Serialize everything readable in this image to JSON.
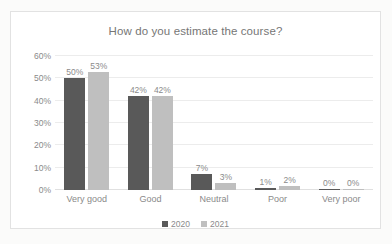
{
  "chart_data": {
    "type": "bar",
    "title": "How do you estimate the course?",
    "xlabel": "",
    "ylabel": "",
    "categories": [
      "Very good",
      "Good",
      "Neutral",
      "Poor",
      "Very poor"
    ],
    "series": [
      {
        "name": "2020",
        "color": "#595959",
        "values": [
          50,
          42,
          7,
          1,
          0
        ],
        "labels": [
          "50%",
          "42%",
          "7%",
          "1%",
          "0%"
        ]
      },
      {
        "name": "2021",
        "color": "#bfbfbf",
        "values": [
          53,
          42,
          3,
          2,
          0
        ],
        "labels": [
          "53%",
          "42%",
          "3%",
          "2%",
          "0%"
        ]
      }
    ],
    "ylim": [
      0,
      60
    ],
    "y_ticks": [
      0,
      10,
      20,
      30,
      40,
      50,
      60
    ],
    "y_tick_labels": [
      "0%",
      "10%",
      "20%",
      "30%",
      "40%",
      "50%",
      "60%"
    ],
    "grid": true,
    "legend_position": "bottom",
    "value_labels": true
  },
  "colors": {
    "title_text": "#767676",
    "axis_text": "#8a8a8a",
    "gridline": "#ececec",
    "frame_border": "#e2e2e2",
    "plot_background": "#ffffff",
    "page_background": "#fbfbfa"
  }
}
